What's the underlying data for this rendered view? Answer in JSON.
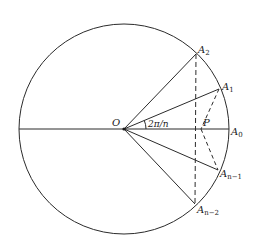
{
  "diagram": {
    "colors": {
      "stroke": "#2b2b2b",
      "background": "#ffffff"
    },
    "circle": {
      "cx": 124,
      "cy": 129,
      "r": 105
    },
    "points": {
      "O": {
        "label": "O",
        "x": 124,
        "y": 129
      },
      "A0": {
        "label": "A",
        "sub": "0",
        "x": 229,
        "y": 129
      },
      "A1": {
        "label": "A",
        "sub": "1",
        "x": 219,
        "y": 89
      },
      "A2": {
        "label": "A",
        "sub": "2",
        "x": 196,
        "y": 54
      },
      "An1": {
        "label": "A",
        "sub": "n−1",
        "x": 218,
        "y": 170
      },
      "An2": {
        "label": "A",
        "sub": "n−2",
        "x": 195,
        "y": 204
      },
      "P": {
        "label": "P",
        "x": 201,
        "y": 129
      }
    },
    "angle_label": "2π/n"
  }
}
